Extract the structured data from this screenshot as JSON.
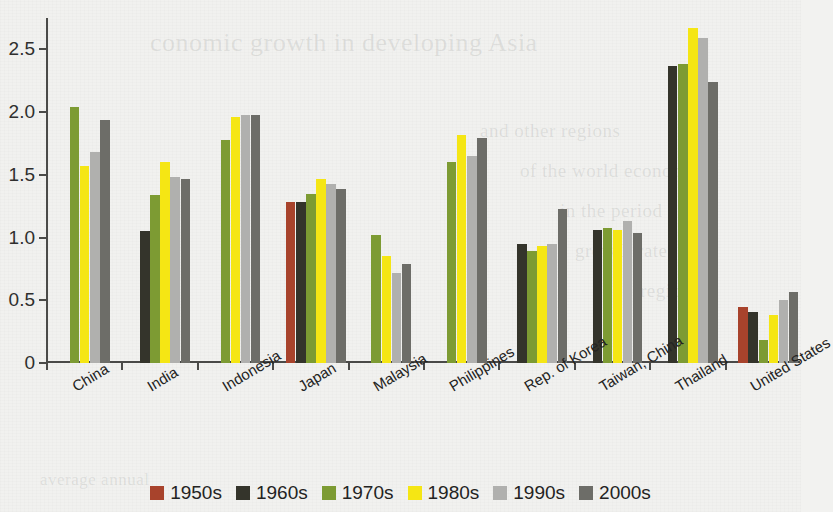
{
  "chart_data": {
    "type": "bar",
    "title": "",
    "xlabel": "",
    "ylabel": "",
    "ylim": [
      0,
      2.75
    ],
    "grid": false,
    "legend_position": "bottom",
    "y_ticks": [
      "0",
      "0.5",
      "1.0",
      "1.5",
      "2.0",
      "2.5"
    ],
    "y_tick_values": [
      0,
      0.5,
      1.0,
      1.5,
      2.0,
      2.5
    ],
    "categories": [
      "China",
      "India",
      "Indonesia",
      "Japan",
      "Malaysia",
      "Philippines",
      "Rep. of Korea",
      "Taiwan, China",
      "Thailand",
      "United States"
    ],
    "series": [
      {
        "name": "1950s",
        "color": "#a8432c",
        "values": [
          null,
          null,
          null,
          1.28,
          null,
          null,
          null,
          null,
          null,
          0.45
        ]
      },
      {
        "name": "1960s",
        "color": "#34342b",
        "values": [
          null,
          1.05,
          null,
          1.28,
          null,
          null,
          0.95,
          1.06,
          2.37,
          0.41
        ]
      },
      {
        "name": "1970s",
        "color": "#7d9b33",
        "values": [
          2.04,
          1.34,
          1.78,
          1.35,
          1.02,
          1.6,
          0.89,
          1.08,
          2.38,
          0.18
        ]
      },
      {
        "name": "1980s",
        "color": "#f5e614",
        "values": [
          1.57,
          1.6,
          1.96,
          1.47,
          0.85,
          1.82,
          0.93,
          1.06,
          2.67,
          0.38
        ]
      },
      {
        "name": "1990s",
        "color": "#b0b0ae",
        "values": [
          1.68,
          1.48,
          1.98,
          1.43,
          0.72,
          1.65,
          0.95,
          1.13,
          2.59,
          0.5
        ]
      },
      {
        "name": "2000s",
        "color": "#6d6d68",
        "values": [
          1.94,
          1.47,
          1.98,
          1.39,
          0.79,
          1.79,
          1.23,
          1.04,
          2.24,
          0.57
        ]
      }
    ]
  },
  "legend": {
    "items": [
      {
        "label": "1950s",
        "color": "#a8432c"
      },
      {
        "label": "1960s",
        "color": "#34342b"
      },
      {
        "label": "1970s",
        "color": "#7d9b33"
      },
      {
        "label": "1980s",
        "color": "#f5e614"
      },
      {
        "label": "1990s",
        "color": "#b0b0ae"
      },
      {
        "label": "2000s",
        "color": "#6d6d68"
      }
    ]
  },
  "background_text": [
    {
      "text": "conomic growth in developing Asia",
      "x": 150,
      "y": 28,
      "size": 26
    },
    {
      "text": "and other regions",
      "x": 480,
      "y": 120,
      "size": 19
    },
    {
      "text": "of the world economy",
      "x": 520,
      "y": 160,
      "size": 19
    },
    {
      "text": "in the period",
      "x": 560,
      "y": 200,
      "size": 19
    },
    {
      "text": "growth rates",
      "x": 575,
      "y": 240,
      "size": 19
    },
    {
      "text": "region",
      "x": 640,
      "y": 280,
      "size": 19
    },
    {
      "text": "average annual",
      "x": 40,
      "y": 470,
      "size": 17
    }
  ]
}
